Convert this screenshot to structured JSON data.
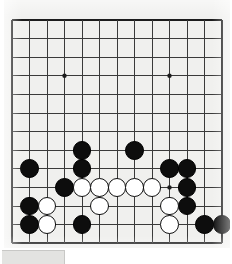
{
  "app": {
    "title": "Go Board Diagram",
    "board_label": "go-board"
  },
  "board": {
    "size": 13,
    "visible_columns": 13,
    "visible_rows": 13,
    "origin_x": 12,
    "origin_y": 20,
    "col_spacing": 17.5,
    "row_spacing": 18.6,
    "line_color": "#3a3a3a",
    "edge_color": "#1c1c1c",
    "board_color": "#f0f0ee",
    "black_color": "#0d0d0d",
    "white_color": "#ffffff",
    "stone_radius": 9.4,
    "star_radius": 2.2,
    "star_points": [
      {
        "col": 3,
        "row": 3
      },
      {
        "col": 9,
        "row": 3
      },
      {
        "col": 9,
        "row": 9
      }
    ],
    "stones": [
      {
        "color": "black",
        "col": 4,
        "row": 7
      },
      {
        "color": "black",
        "col": 7,
        "row": 7
      },
      {
        "color": "black",
        "col": 1,
        "row": 8
      },
      {
        "color": "black",
        "col": 4,
        "row": 8
      },
      {
        "color": "black",
        "col": 9,
        "row": 8
      },
      {
        "color": "black",
        "col": 10,
        "row": 8
      },
      {
        "color": "black",
        "col": 3,
        "row": 9
      },
      {
        "color": "black",
        "col": 10,
        "row": 9
      },
      {
        "color": "black",
        "col": 1,
        "row": 10
      },
      {
        "color": "black",
        "col": 10,
        "row": 10
      },
      {
        "color": "black",
        "col": 1,
        "row": 11
      },
      {
        "color": "black",
        "col": 4,
        "row": 11
      },
      {
        "color": "black",
        "col": 11,
        "row": 11
      },
      {
        "color": "black",
        "col": 12,
        "row": 11
      },
      {
        "color": "white",
        "col": 4,
        "row": 9
      },
      {
        "color": "white",
        "col": 5,
        "row": 9
      },
      {
        "color": "white",
        "col": 6,
        "row": 9
      },
      {
        "color": "white",
        "col": 7,
        "row": 9
      },
      {
        "color": "white",
        "col": 8,
        "row": 9
      },
      {
        "color": "white",
        "col": 2,
        "row": 10
      },
      {
        "color": "white",
        "col": 5,
        "row": 10
      },
      {
        "color": "white",
        "col": 9,
        "row": 10
      },
      {
        "color": "white",
        "col": 2,
        "row": 11
      },
      {
        "color": "white",
        "col": 9,
        "row": 11
      }
    ]
  },
  "bottom_strip": {
    "label": ""
  }
}
